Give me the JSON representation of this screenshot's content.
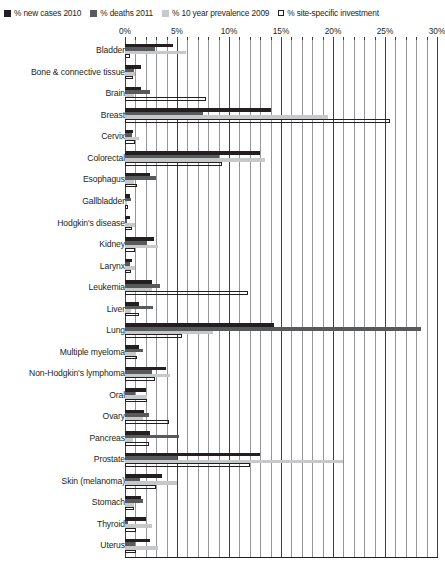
{
  "legend": {
    "items": [
      {
        "label": "% new cases 2010",
        "color": "#231f20",
        "style": "solid",
        "icon": "square-swatch-icon"
      },
      {
        "label": "% deaths 2011",
        "color": "#58595b",
        "style": "solid",
        "icon": "square-swatch-icon"
      },
      {
        "label": "% 10 year prevalence 2009",
        "color": "#c7c8ca",
        "style": "solid",
        "icon": "square-swatch-icon"
      },
      {
        "label": "% site-specific investment",
        "color": "#ffffff",
        "style": "outline",
        "icon": "outlined-square-swatch-icon"
      }
    ]
  },
  "chart_data": {
    "type": "bar",
    "orientation": "horizontal",
    "title": "",
    "xlabel": "",
    "ylabel": "",
    "xlim": [
      0,
      30
    ],
    "xticks": [
      0,
      5,
      10,
      15,
      20,
      25,
      30
    ],
    "xtick_labels": [
      "0%",
      "5%",
      "10%",
      "15%",
      "20%",
      "25%",
      "30%"
    ],
    "minor_tick_step": 1,
    "grid": true,
    "legend_position": "top",
    "categories": [
      "Bladder",
      "Bone & connective tissue",
      "Brain",
      "Breast",
      "Cervix",
      "Colorectal",
      "Esophagus",
      "Gallbladder",
      "Hodgkin's disease",
      "Kidney",
      "Larynx",
      "Leukemia",
      "Liver",
      "Lung",
      "Multiple myeloma",
      "Non-Hodgkin's lymphoma",
      "Oral",
      "Ovary",
      "Pancreas",
      "Prostate",
      "Skin (melanoma)",
      "Stomach",
      "Thyroid",
      "Uterus"
    ],
    "series": [
      {
        "name": "% new cases 2010",
        "color": "#231f20",
        "values": [
          4.6,
          1.5,
          1.5,
          14.0,
          0.8,
          13.0,
          2.4,
          0.5,
          0.5,
          2.8,
          0.7,
          2.6,
          1.3,
          14.3,
          1.3,
          3.9,
          2.0,
          1.8,
          2.4,
          13.0,
          3.6,
          1.5,
          2.0,
          2.4
        ],
        "unit": "%"
      },
      {
        "name": "% deaths 2011",
        "color": "#58595b",
        "values": [
          2.9,
          0.9,
          2.4,
          7.5,
          0.7,
          9.0,
          3.0,
          0.6,
          0.2,
          2.1,
          0.5,
          3.4,
          2.7,
          28.5,
          1.7,
          2.6,
          1.0,
          2.3,
          5.2,
          5.0,
          1.4,
          1.7,
          0.3,
          1.0
        ],
        "unit": "%"
      },
      {
        "name": "% 10 year prevalence 2009",
        "color": "#c7c8ca",
        "values": [
          5.9,
          1.0,
          0.9,
          19.5,
          1.3,
          13.5,
          0.9,
          0.2,
          1.0,
          3.2,
          1.0,
          2.6,
          0.6,
          8.5,
          1.1,
          4.3,
          2.1,
          1.7,
          0.8,
          21.0,
          5.0,
          0.9,
          2.6,
          3.2
        ],
        "unit": "%"
      },
      {
        "name": "% site-specific investment",
        "color": "#ffffff",
        "values": [
          0.5,
          0.8,
          7.8,
          25.5,
          1.0,
          9.3,
          1.2,
          0.3,
          0.7,
          1.0,
          0.6,
          11.8,
          1.3,
          5.5,
          1.2,
          2.9,
          2.1,
          4.2,
          2.3,
          12.0,
          3.0,
          0.9,
          1.1,
          1.1
        ],
        "unit": "%"
      }
    ]
  }
}
